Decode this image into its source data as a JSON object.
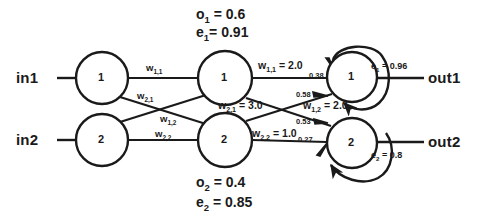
{
  "diagram": {
    "title_hidden": "Recurrent neural network with weights, outputs and errors",
    "stroke_color": "#1a1a1a",
    "background": "#ffffff"
  },
  "inputs": [
    {
      "name": "input-1",
      "label": "in1",
      "x": 30,
      "y": 78
    },
    {
      "name": "input-2",
      "label": "in2",
      "x": 30,
      "y": 140
    }
  ],
  "outputs": [
    {
      "name": "output-1",
      "label": "out1",
      "x": 432,
      "y": 78
    },
    {
      "name": "output-2",
      "label": "out2",
      "x": 432,
      "y": 140
    }
  ],
  "nodes": {
    "layer1": [
      {
        "id": "L1N1",
        "label": "1",
        "cx": 102,
        "cy": 78,
        "r": 26
      },
      {
        "id": "L1N2",
        "label": "2",
        "cx": 102,
        "cy": 140,
        "r": 26
      }
    ],
    "layer2": [
      {
        "id": "L2N1",
        "label": "1",
        "cx": 225,
        "cy": 78,
        "r": 27
      },
      {
        "id": "L2N2",
        "label": "2",
        "cx": 225,
        "cy": 140,
        "r": 27
      }
    ],
    "layer3": [
      {
        "id": "L3N1",
        "label": "1",
        "cx": 352,
        "cy": 77,
        "r": 25
      },
      {
        "id": "L3N2",
        "label": "2",
        "cx": 352,
        "cy": 143,
        "r": 25
      }
    ]
  },
  "hidden_layer_stats": {
    "top": {
      "output_label": "o",
      "output_sub": "1",
      "output_value": "0.6",
      "output_text": "o 1  = 0.6",
      "error_label": "e",
      "error_sub": "1",
      "error_value": "0.91",
      "error_text": "e 1 = 0.91"
    },
    "bottom": {
      "output_label": "o",
      "output_sub": "2",
      "output_value": "0.4",
      "output_text": "o 2  = 0.4",
      "error_label": "e",
      "error_sub": "2",
      "error_value": "0.85",
      "error_text": "e 2 = 0.85"
    }
  },
  "weights_layer1": [
    {
      "name": "weight-1-1",
      "base": "w",
      "sub": "1,1",
      "value": "",
      "x": 146,
      "y": 62
    },
    {
      "name": "weight-2-1",
      "base": "w",
      "sub": "2,1",
      "value": "",
      "x": 137,
      "y": 94
    },
    {
      "name": "weight-1-2",
      "base": "w",
      "sub": "1,2",
      "value": "",
      "x": 158,
      "y": 115
    },
    {
      "name": "weight-2-2",
      "base": "w",
      "sub": "2,2",
      "value": "",
      "x": 152,
      "y": 128
    }
  ],
  "weights_layer2": [
    {
      "name": "weight-out-1-1",
      "base": "w",
      "sub": "1,1",
      "value": " = 2.0",
      "x": 256,
      "y": 61
    },
    {
      "name": "weight-out-2-1",
      "base": "w",
      "sub": "2,1",
      "value": " = 3.0",
      "x": 223,
      "y": 100
    },
    {
      "name": "weight-out-1-2",
      "base": "w",
      "sub": "1,2",
      "value": " = 2.0",
      "x": 303,
      "y": 99
    },
    {
      "name": "weight-out-2-2",
      "base": "w",
      "sub": "2,2",
      "value": " = 1.0",
      "x": 252,
      "y": 128
    }
  ],
  "activations": [
    {
      "name": "activation-0-38",
      "value": "0.38",
      "x": 310,
      "y": 72
    },
    {
      "name": "activation-0-58",
      "value": "0.58",
      "x": 297,
      "y": 92
    },
    {
      "name": "activation-0-53",
      "value": "0.53",
      "x": 297,
      "y": 119
    },
    {
      "name": "activation-0-27",
      "value": "0.27",
      "x": 299,
      "y": 137
    }
  ],
  "output_errors": [
    {
      "name": "output-error-1",
      "base": "e",
      "sub": "1",
      "value": " = 0.96",
      "x": 371,
      "y": 62
    },
    {
      "name": "output-error-2",
      "base": "e",
      "sub": "2",
      "value": " = 0.8",
      "x": 371,
      "y": 152
    }
  ]
}
